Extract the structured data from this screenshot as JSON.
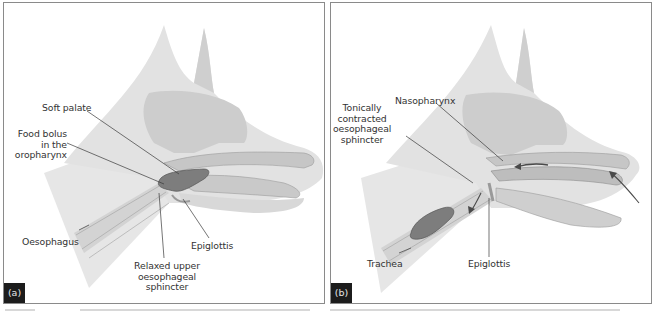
{
  "figure": {
    "panels": [
      {
        "id": "a",
        "tag": "(a)",
        "labels": {
          "soft_palate": "Soft palate",
          "food_bolus_1": "Food bolus",
          "food_bolus_2": "in the",
          "food_bolus_3": "oropharynx",
          "oesophagus": "Oesophagus",
          "epiglottis": "Epiglottis",
          "relaxed_1": "Relaxed upper",
          "relaxed_2": "oesophageal",
          "relaxed_3": "sphincter"
        }
      },
      {
        "id": "b",
        "tag": "(b)",
        "labels": {
          "nasopharynx": "Nasopharynx",
          "tonically_1": "Tonically",
          "tonically_2": "contracted",
          "tonically_3": "oesophageal",
          "tonically_4": "sphincter",
          "trachea": "Trachea",
          "epiglottis": "Epiglottis"
        }
      }
    ],
    "colors": {
      "background": "#ffffff",
      "panel_border": "#8a8a8a",
      "head_light": "#e4e4e4",
      "head_mid": "#d2d2d2",
      "head_dark": "#bdbdbd",
      "bolus": "#7d7d7d",
      "leader_line": "#3a3a3a",
      "tag_bg": "#1c1c1c",
      "tag_text": "#e6e6e6",
      "label_text": "#333333"
    }
  }
}
